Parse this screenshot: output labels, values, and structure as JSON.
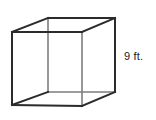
{
  "figure": {
    "kind": "geometry-diagram",
    "shape_name": "cube",
    "projection": "oblique-parallel",
    "background_color": "#ffffff",
    "edge_color_visible": "#2b2b2b",
    "edge_color_hidden": "#7d7d7d",
    "edge_width_visible": 2.0,
    "edge_width_hidden": 1.6,
    "labels": {
      "height": {
        "text": "9 ft.",
        "value": 9,
        "unit": "ft.",
        "position": "right-of-figure"
      }
    },
    "vertices": {
      "front_top_left": [
        12,
        32
      ],
      "front_top_right": [
        82,
        32
      ],
      "front_bottom_right": [
        82,
        106
      ],
      "front_bottom_left": [
        12,
        105
      ],
      "back_top_left": [
        48,
        18
      ],
      "back_top_right": [
        115,
        18
      ],
      "back_bottom_right": [
        115,
        92
      ],
      "back_bottom_left": [
        48,
        92
      ]
    },
    "edges": [
      {
        "name": "front-top",
        "from": "front_top_left",
        "to": "front_top_right",
        "hidden": false
      },
      {
        "name": "front-right",
        "from": "front_top_right",
        "to": "front_bottom_right",
        "hidden": true
      },
      {
        "name": "front-bottom",
        "from": "front_bottom_left",
        "to": "front_bottom_right",
        "hidden": false
      },
      {
        "name": "front-left",
        "from": "front_top_left",
        "to": "front_bottom_left",
        "hidden": false
      },
      {
        "name": "back-top",
        "from": "back_top_left",
        "to": "back_top_right",
        "hidden": false
      },
      {
        "name": "back-right",
        "from": "back_top_right",
        "to": "back_bottom_right",
        "hidden": false
      },
      {
        "name": "back-bottom",
        "from": "back_bottom_left",
        "to": "back_bottom_right",
        "hidden": true
      },
      {
        "name": "back-left",
        "from": "back_top_left",
        "to": "back_bottom_left",
        "hidden": true
      },
      {
        "name": "connector-top-left",
        "from": "front_top_left",
        "to": "back_top_left",
        "hidden": false
      },
      {
        "name": "connector-top-right",
        "from": "front_top_right",
        "to": "back_top_right",
        "hidden": false
      },
      {
        "name": "connector-bottom-left",
        "from": "front_bottom_left",
        "to": "back_bottom_left",
        "hidden": false
      },
      {
        "name": "connector-bottom-right",
        "from": "front_bottom_right",
        "to": "back_bottom_right",
        "hidden": false
      }
    ]
  }
}
